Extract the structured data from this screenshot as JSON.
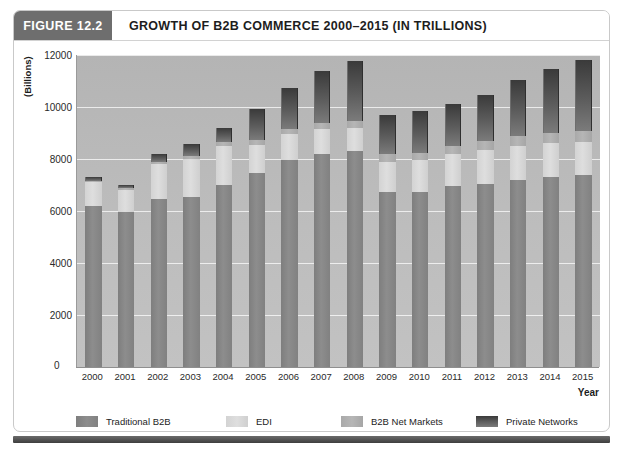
{
  "figure": {
    "tag": "FIGURE 12.2",
    "title": "GROWTH OF B2B COMMERCE 2000–2015 (IN TRILLIONS)"
  },
  "chart_data": {
    "type": "bar",
    "title": "GROWTH OF B2B COMMERCE 2000–2015 (IN TRILLIONS)",
    "stacked": true,
    "xlabel": "Year",
    "ylabel": "(Billions)",
    "ylim": [
      0,
      12000
    ],
    "ytick_values": [
      0,
      2000,
      4000,
      6000,
      8000,
      10000,
      12000
    ],
    "ytick_labels": [
      "0",
      "2000",
      "4000",
      "6000",
      "8000",
      "10000",
      "12000"
    ],
    "grid": true,
    "legend_position": "bottom",
    "categories": [
      "2000",
      "2001",
      "2002",
      "2003",
      "2004",
      "2005",
      "2006",
      "2007",
      "2008",
      "2009",
      "2010",
      "2011",
      "2012",
      "2013",
      "2014",
      "2015"
    ],
    "series": [
      {
        "name": "Traditional B2B",
        "color": "#858585",
        "values": [
          6200,
          5950,
          6450,
          6550,
          7000,
          7450,
          7950,
          8200,
          8300,
          6750,
          6750,
          6950,
          7050,
          7200,
          7300,
          7400
        ]
      },
      {
        "name": "EDI",
        "color": "#d8d8d8",
        "values": [
          900,
          870,
          1350,
          1450,
          1500,
          1100,
          1000,
          950,
          900,
          1150,
          1200,
          1250,
          1300,
          1300,
          1300,
          1250
        ]
      },
      {
        "name": "B2B Net Markets",
        "color": "#b0b0b0",
        "values": [
          50,
          50,
          100,
          120,
          150,
          180,
          220,
          250,
          280,
          280,
          300,
          320,
          350,
          380,
          400,
          420
        ]
      },
      {
        "name": "Private Networks",
        "color": "#4a4a4a",
        "values": [
          150,
          120,
          300,
          450,
          550,
          1200,
          1550,
          2000,
          2300,
          1500,
          1600,
          1600,
          1750,
          2150,
          2450,
          2750
        ]
      }
    ],
    "totals": [
      7300,
      6990,
      8200,
      8570,
      9200,
      9930,
      10720,
      11400,
      11780,
      9680,
      9850,
      10120,
      10450,
      11030,
      11450,
      11820
    ]
  },
  "legend": {
    "items": [
      {
        "label": "Traditional B2B"
      },
      {
        "label": "EDI"
      },
      {
        "label": "B2B Net Markets"
      },
      {
        "label": "Private Networks"
      }
    ]
  }
}
